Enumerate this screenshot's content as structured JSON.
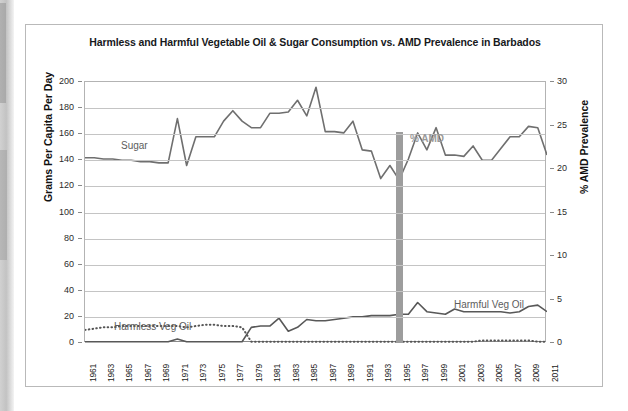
{
  "chart_data": {
    "type": "line",
    "title": "Harmless and Harmful Vegetable Oil & Sugar Consumption vs. AMD Prevalence in Barbados",
    "xlabel": "",
    "ylabel": "Grams Per Capita Per Day",
    "y2label": "% AMD Prevalence",
    "ylim": [
      0,
      200
    ],
    "y2lim": [
      0,
      30
    ],
    "ytick_labels": [
      "0",
      "20",
      "40",
      "60",
      "80",
      "100",
      "120",
      "140",
      "160",
      "180",
      "200"
    ],
    "y2tick_labels": [
      "0",
      "5",
      "10",
      "15",
      "20",
      "25",
      "30"
    ],
    "grid": true,
    "legend": "inline-annotations",
    "xlim": [
      1961,
      2011
    ],
    "xtick_labels": [
      "1961",
      "1963",
      "1965",
      "1967",
      "1969",
      "1971",
      "1973",
      "1975",
      "1977",
      "1979",
      "1981",
      "1983",
      "1985",
      "1987",
      "1989",
      "1991",
      "1993",
      "1995",
      "1997",
      "1999",
      "2001",
      "2003",
      "2005",
      "2007",
      "2009",
      "2011"
    ],
    "x": [
      1961,
      1962,
      1963,
      1964,
      1965,
      1966,
      1967,
      1968,
      1969,
      1970,
      1971,
      1972,
      1973,
      1974,
      1975,
      1976,
      1977,
      1978,
      1979,
      1980,
      1981,
      1982,
      1983,
      1984,
      1985,
      1986,
      1987,
      1988,
      1989,
      1990,
      1991,
      1992,
      1993,
      1994,
      1995,
      1996,
      1997,
      1998,
      1999,
      2000,
      2001,
      2002,
      2003,
      2004,
      2005,
      2006,
      2007,
      2008,
      2009,
      2010,
      2011
    ],
    "series": [
      {
        "name": "Sugar",
        "axis": "left",
        "style": "solid",
        "color": "#6f6f6f",
        "values": [
          142,
          142,
          141,
          141,
          140,
          140,
          139,
          139,
          138,
          138,
          172,
          136,
          158,
          158,
          158,
          170,
          178,
          170,
          165,
          165,
          176,
          176,
          177,
          186,
          174,
          196,
          162,
          162,
          161,
          170,
          148,
          147,
          126,
          136,
          125,
          141,
          161,
          148,
          165,
          144,
          144,
          143,
          151,
          140,
          140,
          149,
          158,
          158,
          166,
          165,
          144
        ]
      },
      {
        "name": "Harmless Veg Oil",
        "axis": "left",
        "style": "dotted",
        "color": "#555555",
        "values": [
          10,
          11,
          12,
          12,
          13,
          13,
          13,
          13,
          13,
          13,
          13,
          12,
          13,
          14,
          14,
          13,
          13,
          12,
          1,
          1,
          1,
          1,
          1,
          1,
          1,
          1,
          1,
          1,
          1,
          1,
          1,
          1,
          1,
          1,
          1,
          1,
          1,
          1,
          1,
          1,
          1,
          1,
          1,
          2,
          2,
          2,
          2,
          2,
          2,
          1,
          1
        ]
      },
      {
        "name": "Harmful Veg Oil",
        "axis": "left",
        "style": "solid",
        "color": "#585858",
        "values": [
          1,
          1,
          1,
          1,
          1,
          1,
          1,
          1,
          1,
          1,
          3,
          1,
          1,
          1,
          1,
          1,
          1,
          1,
          12,
          13,
          13,
          19,
          9,
          12,
          18,
          17,
          17,
          18,
          19,
          20,
          20,
          21,
          21,
          21,
          22,
          22,
          31,
          24,
          23,
          22,
          26,
          24,
          24,
          24,
          24,
          24,
          23,
          24,
          28,
          29,
          24
        ]
      },
      {
        "name": "% AMD",
        "axis": "right",
        "style": "bar",
        "color": "#9d9d9d",
        "points": [
          {
            "x": 1995,
            "y": 24.2
          }
        ]
      }
    ],
    "annotations": [
      {
        "text": "Sugar",
        "x": 1964,
        "y": 168
      },
      {
        "text": "Harmless Veg Oil",
        "x": 1963,
        "y": 30
      },
      {
        "text": "Harmful Veg Oil",
        "x": 1998,
        "y": 46
      },
      {
        "text": "% AMD",
        "x": 1994,
        "y": 173
      }
    ]
  },
  "axes": {
    "left_title": "Grams Per Capita Per Day",
    "right_title": "% AMD Prevalence"
  },
  "labels": {
    "sugar": "Sugar",
    "harmless": "Harmless Veg Oil",
    "harmful": "Harmful Veg Oil",
    "amd": "% AMD"
  }
}
